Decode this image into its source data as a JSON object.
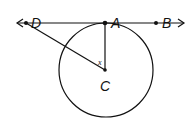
{
  "diagram": {
    "type": "geometry",
    "colors": {
      "stroke": "#111111",
      "background": "#ffffff"
    },
    "points": {
      "D": {
        "label": "D",
        "x": 26,
        "y": 23
      },
      "A": {
        "label": "A",
        "x": 105,
        "y": 23
      },
      "B": {
        "label": "B",
        "x": 156,
        "y": 23
      },
      "C": {
        "label": "C",
        "x": 105,
        "y": 70
      }
    },
    "circle": {
      "center": "C",
      "cx": 106,
      "cy": 70,
      "r": 47
    },
    "line": {
      "name": "tangent line DB",
      "through": [
        "D",
        "A",
        "B"
      ],
      "arrows": "both"
    },
    "segments": [
      {
        "from": "A",
        "to": "C"
      },
      {
        "from": "D",
        "to": "C"
      }
    ],
    "angle_label": {
      "text": "x",
      "at": "C",
      "between": [
        "CA",
        "CD"
      ]
    }
  }
}
